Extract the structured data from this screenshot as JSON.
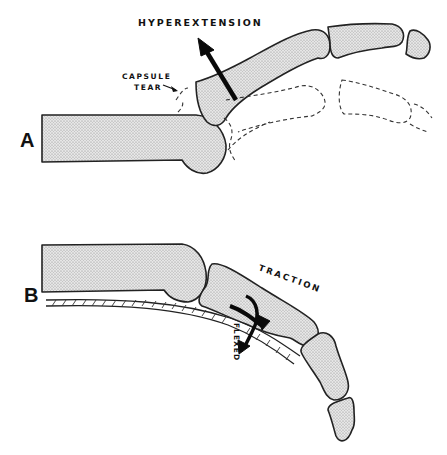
{
  "figure": {
    "type": "anatomical-diagram",
    "panels": [
      {
        "id": "A",
        "letter": "A",
        "labels": {
          "motion": "HYPEREXTENSION",
          "injury_line1": "CAPSULE",
          "injury_line2": "TEAR"
        }
      },
      {
        "id": "B",
        "letter": "B",
        "labels": {
          "force": "TRACTION",
          "position": "FLEXED"
        }
      }
    ],
    "colors": {
      "ink": "#111111",
      "bone_fill": "#d9d9d9",
      "background": "#ffffff"
    }
  }
}
